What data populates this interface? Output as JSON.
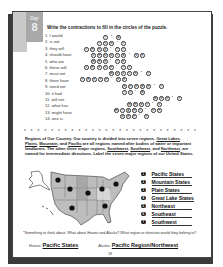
{
  "day_tab": {
    "label": "Day",
    "number": "8"
  },
  "instructions": "Write the contractions to fill in the circles of the puzzle.",
  "clues": [
    "1. I would",
    "2. is not",
    "3. they will",
    "4. should have",
    "5. who are",
    "6. these will",
    "7. must not",
    "8. there have",
    "9. need not",
    "10. it had",
    "11. will not",
    "12. what has",
    "13. might have",
    "14. one is"
  ],
  "puzzle_rows": [
    {
      "y": 35,
      "cells": [
        {
          "x": 103,
          "c": "I"
        },
        {
          "x": 110,
          "c": "'"
        },
        {
          "x": 116,
          "c": "d"
        }
      ]
    },
    {
      "y": 41,
      "cells": [
        {
          "x": 97,
          "c": "i"
        },
        {
          "x": 103,
          "c": "s"
        },
        {
          "x": 109,
          "c": "n"
        },
        {
          "x": 116,
          "c": "'"
        },
        {
          "x": 121,
          "c": "t"
        }
      ]
    },
    {
      "y": 47,
      "cells": [
        {
          "x": 84,
          "c": "t"
        },
        {
          "x": 90,
          "c": "h"
        },
        {
          "x": 97,
          "c": "e"
        },
        {
          "x": 103,
          "c": "y"
        },
        {
          "x": 109,
          "c": "'"
        },
        {
          "x": 115,
          "c": "l"
        },
        {
          "x": 121,
          "c": "l"
        }
      ]
    },
    {
      "y": 53,
      "cells": [
        {
          "x": 91,
          "c": "s"
        },
        {
          "x": 97,
          "c": "h"
        },
        {
          "x": 103,
          "c": "o"
        },
        {
          "x": 109,
          "c": "u"
        },
        {
          "x": 115,
          "c": "l"
        },
        {
          "x": 121,
          "c": "d"
        },
        {
          "x": 128,
          "c": "'"
        },
        {
          "x": 134,
          "c": "v"
        },
        {
          "x": 140,
          "c": "e"
        }
      ]
    },
    {
      "y": 59,
      "cells": [
        {
          "x": 91,
          "c": "w"
        },
        {
          "x": 97,
          "c": "h"
        },
        {
          "x": 103,
          "c": "o"
        },
        {
          "x": 109,
          "c": "'"
        },
        {
          "x": 115,
          "c": "r"
        },
        {
          "x": 121,
          "c": "e"
        }
      ]
    },
    {
      "y": 65,
      "cells": [
        {
          "x": 84,
          "c": "t"
        },
        {
          "x": 90,
          "c": "h"
        },
        {
          "x": 97,
          "c": "e"
        },
        {
          "x": 103,
          "c": "s"
        },
        {
          "x": 109,
          "c": "e"
        },
        {
          "x": 115,
          "c": "'"
        },
        {
          "x": 121,
          "c": "l"
        },
        {
          "x": 127,
          "c": "l"
        }
      ]
    },
    {
      "y": 71,
      "cells": [
        {
          "x": 109,
          "c": "m"
        },
        {
          "x": 115,
          "c": "u"
        },
        {
          "x": 121,
          "c": "s"
        },
        {
          "x": 127,
          "c": "t"
        },
        {
          "x": 133,
          "c": "n"
        },
        {
          "x": 140,
          "c": "'"
        },
        {
          "x": 146,
          "c": "t"
        }
      ]
    },
    {
      "y": 77,
      "cells": [
        {
          "x": 80,
          "c": "t"
        },
        {
          "x": 86,
          "c": "h"
        },
        {
          "x": 92,
          "c": "e"
        },
        {
          "x": 98,
          "c": "r"
        },
        {
          "x": 104,
          "c": "e"
        },
        {
          "x": 110,
          "c": "'"
        },
        {
          "x": 116,
          "c": "v"
        },
        {
          "x": 122,
          "c": "e"
        }
      ]
    },
    {
      "y": 84,
      "cells": [
        {
          "x": 122,
          "c": "n"
        },
        {
          "x": 128,
          "c": "e"
        },
        {
          "x": 134,
          "c": "e"
        },
        {
          "x": 140,
          "c": "d"
        },
        {
          "x": 146,
          "c": "n"
        },
        {
          "x": 153,
          "c": "'"
        },
        {
          "x": 159,
          "c": "t"
        }
      ]
    },
    {
      "y": 90,
      "cells": [
        {
          "x": 122,
          "c": "i"
        },
        {
          "x": 128,
          "c": "t"
        },
        {
          "x": 134,
          "c": "'"
        },
        {
          "x": 140,
          "c": "d"
        }
      ]
    },
    {
      "y": 96,
      "cells": [
        {
          "x": 153,
          "c": "w"
        },
        {
          "x": 159,
          "c": "o"
        },
        {
          "x": 165,
          "c": "n"
        },
        {
          "x": 171,
          "c": "'"
        },
        {
          "x": 177,
          "c": "t"
        }
      ]
    },
    {
      "y": 102,
      "cells": [
        {
          "x": 127,
          "c": "w"
        },
        {
          "x": 133,
          "c": "h"
        },
        {
          "x": 139,
          "c": "a"
        },
        {
          "x": 145,
          "c": "t"
        },
        {
          "x": 151,
          "c": "'"
        },
        {
          "x": 157,
          "c": "s"
        }
      ]
    },
    {
      "y": 108,
      "cells": [
        {
          "x": 114,
          "c": "m"
        },
        {
          "x": 120,
          "c": "i"
        },
        {
          "x": 126,
          "c": "g"
        },
        {
          "x": 132,
          "c": "h"
        },
        {
          "x": 138,
          "c": "t"
        },
        {
          "x": 144,
          "c": "'"
        },
        {
          "x": 151,
          "c": "v"
        },
        {
          "x": 157,
          "c": "e"
        }
      ]
    },
    {
      "y": 114,
      "cells": [
        {
          "x": 120,
          "c": "o"
        },
        {
          "x": 126,
          "c": "n"
        },
        {
          "x": 132,
          "c": "e"
        },
        {
          "x": 138,
          "c": "'"
        },
        {
          "x": 144,
          "c": "s"
        }
      ]
    }
  ],
  "divider": "* * * * * * * * * * * * * * * * * * * * * * * * * * * * * * *",
  "paragraph": {
    "lead": "Regions of Our Country.",
    "text1": " Our country is divided into seven regions. ",
    "u1": "Great Lakes",
    "s1": ", ",
    "u2": "Plains",
    "s2": ", ",
    "u3": "Mountain",
    "s3": ", and ",
    "u4": "Pacific",
    "text2": " are all regions named after bodies of water or important landforms. The other three major regions, ",
    "u5": "Southwest",
    "s5": ", ",
    "u6": "Southeast",
    "s6": ", and ",
    "u7": "Northeast",
    "text3": ", are named for intermediate directions. Label the seven major regions of our United States."
  },
  "regions": [
    {
      "num": "1",
      "answer": "Pacific States"
    },
    {
      "num": "2",
      "answer": "Mountain States"
    },
    {
      "num": "3",
      "answer": "Plain States"
    },
    {
      "num": "4",
      "answer": "Great Lake States"
    },
    {
      "num": "5",
      "answer": "Northeast"
    },
    {
      "num": "6",
      "answer": "Southeast"
    },
    {
      "num": "7",
      "answer": "Southwest"
    }
  ],
  "think": "*Something to think about. What about Hawaii and Alaska? What region or direction would they belong to?",
  "hawaii": {
    "label": "Hawaii",
    "answer": "Pacific States"
  },
  "alaska": {
    "label": "Alaska",
    "answer": "Pacific Region/Northwest"
  },
  "page_number": "18",
  "colors": {
    "tab_light": "#c9c9c9",
    "tab_dark": "#a8a8a8",
    "shadow": "#3a3a3a"
  }
}
